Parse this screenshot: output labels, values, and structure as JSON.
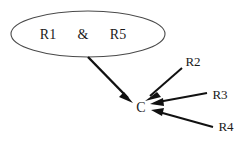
{
  "diagram": {
    "type": "causal-dependency-diagram",
    "background_color": "#ffffff",
    "line_color": "#111111",
    "group_stroke_color": "#4a4a4a",
    "text_color": "#1a1a1a",
    "group_node": {
      "shape": "ellipse",
      "operator": "&",
      "members": [
        {
          "label": "R1"
        },
        {
          "label": "R5"
        }
      ]
    },
    "center_node": {
      "label": "C"
    },
    "source_nodes": [
      {
        "label": "R2"
      },
      {
        "label": "R3"
      },
      {
        "label": "R4"
      }
    ],
    "edges": [
      {
        "from": "R1 & R5",
        "to": "C",
        "style": "thick-arrow"
      },
      {
        "from": "R2",
        "to": "C",
        "style": "arrow"
      },
      {
        "from": "R3",
        "to": "C",
        "style": "arrow"
      },
      {
        "from": "R4",
        "to": "C",
        "style": "arrow"
      }
    ]
  }
}
